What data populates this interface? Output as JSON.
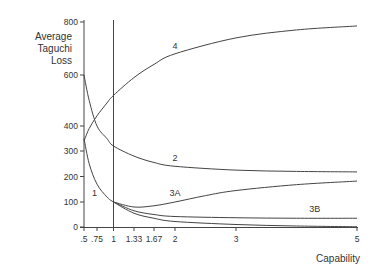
{
  "chart_data": {
    "type": "line",
    "title": "",
    "xlabel": "Capability",
    "ylabel": "Average Taguchi Loss",
    "ylabel_lines": [
      "Average",
      "Taguchi",
      "Loss"
    ],
    "xlim": [
      0.5,
      5
    ],
    "ylim": [
      0,
      800
    ],
    "grid": false,
    "legend": "inline curve labels",
    "x_ticks": [
      {
        "value": 0.5,
        "label": ".5"
      },
      {
        "value": 0.75,
        "label": ".75"
      },
      {
        "value": 1,
        "label": "1"
      },
      {
        "value": 1.33,
        "label": "1.33"
      },
      {
        "value": 1.67,
        "label": "1.67"
      },
      {
        "value": 2,
        "label": "2"
      },
      {
        "value": 3,
        "label": "3"
      },
      {
        "value": 5,
        "label": "5"
      }
    ],
    "y_ticks": [
      {
        "value": 0,
        "label": "0"
      },
      {
        "value": 100,
        "label": "100"
      },
      {
        "value": 200,
        "label": "200"
      },
      {
        "value": 300,
        "label": "300"
      },
      {
        "value": 400,
        "label": "400"
      },
      {
        "value": 600,
        "label": "600"
      },
      {
        "value": 800,
        "label": "800"
      }
    ],
    "reference_line": {
      "x": 1,
      "description": "vertical line at capability 1"
    },
    "series": [
      {
        "name": "1",
        "x": [
          0.5,
          0.6,
          0.75,
          0.9,
          1,
          1.33,
          1.67,
          2,
          3,
          4,
          5
        ],
        "values": [
          350,
          250,
          170,
          120,
          100,
          55,
          35,
          22,
          10,
          4,
          1
        ],
        "label_pos": {
          "x": 0.7,
          "y": 125
        }
      },
      {
        "name": "2",
        "x": [
          0.5,
          0.6,
          0.75,
          0.9,
          1,
          1.33,
          1.67,
          2,
          3,
          4,
          5
        ],
        "values": [
          600,
          500,
          400,
          350,
          320,
          280,
          255,
          240,
          225,
          220,
          218
        ],
        "label_pos": {
          "x": 2,
          "y": 262
        }
      },
      {
        "name": "3A",
        "x": [
          1,
          1.33,
          1.67,
          2,
          2.5,
          3,
          4,
          5
        ],
        "values": [
          100,
          80,
          85,
          100,
          125,
          145,
          168,
          182
        ],
        "label_pos": {
          "x": 2,
          "y": 125
        }
      },
      {
        "name": "3B",
        "x": [
          1,
          1.33,
          1.67,
          2,
          3,
          4,
          5
        ],
        "values": [
          100,
          65,
          50,
          42,
          37,
          35,
          35
        ],
        "label_pos": {
          "x": 4.3,
          "y": 60
        }
      },
      {
        "name": "4",
        "x": [
          0.5,
          0.6,
          0.75,
          0.9,
          1,
          1.33,
          1.67,
          2,
          3,
          4,
          5
        ],
        "values": [
          340,
          390,
          440,
          490,
          520,
          590,
          640,
          680,
          740,
          770,
          785
        ],
        "label_pos": {
          "x": 2,
          "y": 700
        }
      }
    ]
  }
}
